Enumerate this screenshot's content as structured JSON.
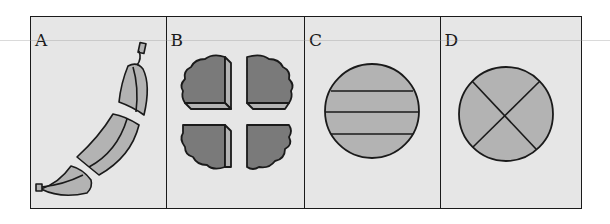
{
  "figure": {
    "panels": [
      {
        "label": "A",
        "content": "banana cut into three pieces"
      },
      {
        "label": "B",
        "content": "round cake cut into four quarters"
      },
      {
        "label": "C",
        "content": "circle divided by three horizontal lines into four strips"
      },
      {
        "label": "D",
        "content": "circle divided by two diagonals into four equal parts"
      }
    ]
  },
  "colors": {
    "background": "#e6e6e6",
    "outline": "#1a1a1a",
    "fill_light": "#b3b3b3",
    "fill_dark": "#7a7a7a"
  }
}
